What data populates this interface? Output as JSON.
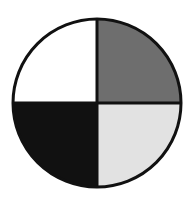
{
  "chart_data": {
    "type": "pie",
    "title": "",
    "categories": [
      "Top-right (dark grey)",
      "Bottom-right (light grey)",
      "Bottom-left (black)",
      "Top-left (white)"
    ],
    "values": [
      25,
      25,
      25,
      25
    ],
    "colors": [
      "#6e6e6e",
      "#e2e2e2",
      "#111111",
      "#ffffff"
    ],
    "outline_color": "#111111",
    "legend": "none",
    "labels": "none"
  },
  "geometry": {
    "cx": 97,
    "cy": 103,
    "r": 84,
    "stroke_width": 3
  }
}
